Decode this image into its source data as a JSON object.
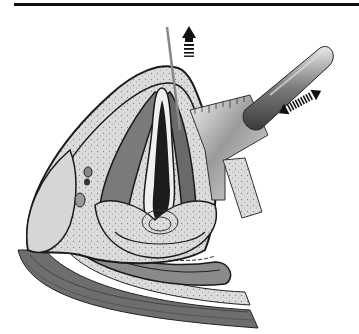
{
  "figure": {
    "type": "anatomical-illustration",
    "style": "grayscale line drawing",
    "top_rule": {
      "color": "#111111"
    },
    "colors": {
      "outline": "#1a1a1a",
      "light_tissue": "#d9d9d9",
      "mid_tissue": "#8a8a8a",
      "dark_tissue": "#3a3a3a",
      "cavity": "#1c1c1c",
      "instrument": "#9a9a9a",
      "arrow": "#111111"
    },
    "elements": [
      {
        "name": "upward-arrow",
        "description": "striped upward arrow near needle"
      },
      {
        "name": "needle",
        "description": "thin vertical needle piercing tissue"
      },
      {
        "name": "ruler-blade",
        "description": "graduated retractor blade"
      },
      {
        "name": "cylindrical-instrument",
        "description": "textured cylindrical handle"
      },
      {
        "name": "bidirectional-arrow",
        "description": "double-headed striped arrow indicating back-and-forth motion"
      },
      {
        "name": "tissue-cross-section",
        "description": "layered sagittal tissue section with central cavity"
      }
    ]
  }
}
